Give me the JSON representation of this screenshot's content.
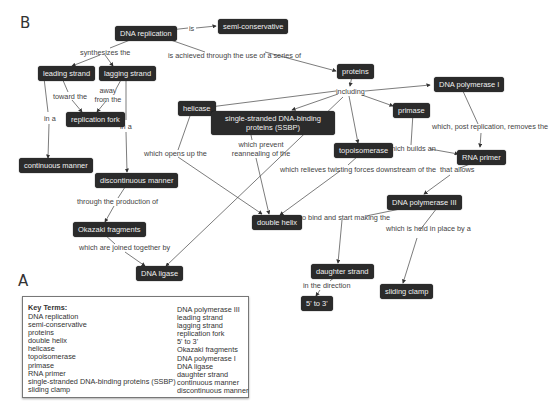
{
  "panels": {
    "b_label": "B",
    "a_label": "A"
  },
  "nodes": {
    "dna_replication": "DNA replication",
    "semi_conservative": "semi-conservative",
    "leading_strand": "leading strand",
    "lagging_strand": "lagging strand",
    "replication_fork": "replication fork",
    "continuous_manner": "continuous manner",
    "discontinuous_manner": "discontinuous manner",
    "okazaki_fragments": "Okazaki fragments",
    "dna_ligase": "DNA ligase",
    "proteins": "proteins",
    "helicase": "helicase",
    "ssbp": "single-stranded DNA-binding proteins (SSBP)",
    "topoisomerase": "topoisomerase",
    "primase": "primase",
    "dna_polymerase_1": "DNA polymerase I",
    "rna_primer": "RNA primer",
    "double_helix": "double helix",
    "dna_polymerase_3": "DNA polymerase III",
    "daughter_strand": "daughter strand",
    "five_to_three": "5' to 3'",
    "sliding_clamp": "sliding clamp"
  },
  "links": {
    "is": "is",
    "achieved": "is achieved through the use of a series of",
    "synthesizes": "synthesizes the",
    "toward": "toward the",
    "away": "away from the",
    "in_a_1": "in a",
    "in_a_2": "in a",
    "through_production": "through the production of",
    "joined": "which are joined together by",
    "including": "including",
    "opens": "which opens up the",
    "prevent": "which prevent reannealing of the",
    "relieves": "which relieves twisting forces downstream of the",
    "builds": "which builds an",
    "post_replication": "which, post replication, removes the",
    "allows": "that allows",
    "bind": "to bind and start making the",
    "held": "which is held in place by a",
    "direction": "in the direction"
  },
  "key_terms": {
    "title": "Key Terms:",
    "col1": [
      "DNA replication",
      "semi-conservative",
      "proteins",
      "double helix",
      "helicase",
      "topoisomerase",
      "primase",
      "RNA primer",
      "single-stranded DNA-binding proteins (SSBP)",
      "sliding clamp"
    ],
    "col2": [
      "DNA polymerase III",
      "leading strand",
      "lagging strand",
      "replication fork",
      "5' to 3'",
      "Okazaki fragments",
      "DNA polymerase I",
      "DNA ligase",
      "daughter strand",
      "continuous manner",
      "discontinuous manner"
    ]
  }
}
